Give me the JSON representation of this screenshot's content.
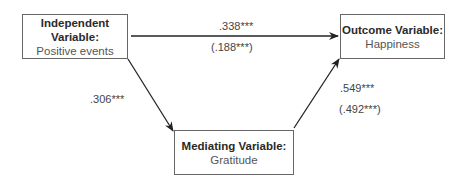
{
  "diagram": {
    "nodes": {
      "independent": {
        "title": "Independent Variable:",
        "subtitle": "Positive events"
      },
      "outcome": {
        "title": "Outcome Variable:",
        "subtitle": "Happiness"
      },
      "mediator": {
        "title": "Mediating Variable:",
        "subtitle": "Gratitude"
      }
    },
    "paths": {
      "direct": {
        "coef": ".338***",
        "coef_controlled": "(.188***)"
      },
      "a_path": {
        "coef": ".306***"
      },
      "b_path": {
        "coef": ".549***",
        "coef_controlled": "(.492***)"
      }
    },
    "colors": {
      "line": "#222222",
      "box_border": "#666666"
    }
  }
}
